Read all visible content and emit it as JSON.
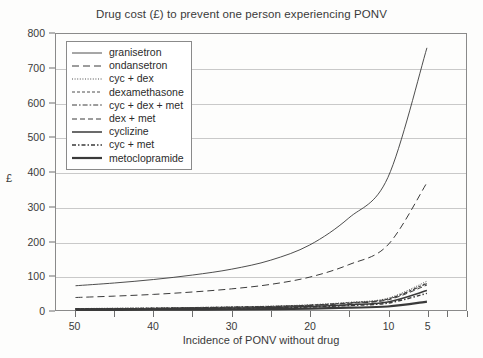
{
  "chart_data": {
    "type": "line",
    "title": "Drug cost (£) to prevent one person experiencing PONV",
    "xlabel": "Incidence of PONV without drug",
    "ylabel": "£",
    "x": [
      50,
      45,
      40,
      35,
      30,
      25,
      20,
      15,
      10,
      5
    ],
    "x_tick_labels": [
      "50",
      "",
      "40",
      "",
      "30",
      "",
      "20",
      "",
      "10",
      "",
      "5",
      "",
      ""
    ],
    "x_ticks_major": [
      50,
      40,
      30,
      20,
      10,
      5
    ],
    "xlim": [
      52.5,
      0
    ],
    "ylim": [
      0,
      800
    ],
    "y_ticks": [
      0,
      100,
      200,
      300,
      400,
      500,
      600,
      700,
      800
    ],
    "grid": "horizontal",
    "legend_position": "upper-left-inside",
    "series": [
      {
        "name": "granisetron",
        "style": "solid-thin",
        "values": [
          72,
          80,
          90,
          103,
          120,
          146,
          190,
          268,
          385,
          760
        ]
      },
      {
        "name": "ondansetron",
        "style": "long-dash",
        "values": [
          38,
          42,
          47,
          54,
          63,
          76,
          97,
          133,
          190,
          370
        ]
      },
      {
        "name": "cyc + dex",
        "style": "dotted",
        "values": [
          6,
          7,
          8,
          9,
          11,
          13,
          17,
          24,
          36,
          85
        ]
      },
      {
        "name": "dexamethasone",
        "style": "fine-dash",
        "values": [
          6,
          6.5,
          7.5,
          9,
          10.5,
          12.5,
          16,
          23,
          34,
          80
        ]
      },
      {
        "name": "cyc + dex + met",
        "style": "dash-dot",
        "values": [
          5.5,
          6,
          7,
          8.5,
          10,
          12,
          15.5,
          22,
          33,
          78
        ]
      },
      {
        "name": "dex + met",
        "style": "medium-dash",
        "values": [
          5,
          5.5,
          6.5,
          8,
          9.5,
          11.5,
          15,
          21,
          31,
          74
        ]
      },
      {
        "name": "cyclizine",
        "style": "solid-medium",
        "values": [
          4,
          4.5,
          5,
          6,
          7.5,
          9,
          12,
          17,
          25,
          58
        ]
      },
      {
        "name": "cyc + met",
        "style": "dash-dot-thick",
        "values": [
          3.5,
          4,
          4.5,
          5.5,
          6.5,
          8,
          10.5,
          15,
          22,
          50
        ]
      },
      {
        "name": "metoclopramide",
        "style": "solid-thick",
        "values": [
          2,
          2.2,
          2.5,
          3,
          3.5,
          4.5,
          6,
          8.5,
          12,
          26
        ]
      }
    ]
  }
}
